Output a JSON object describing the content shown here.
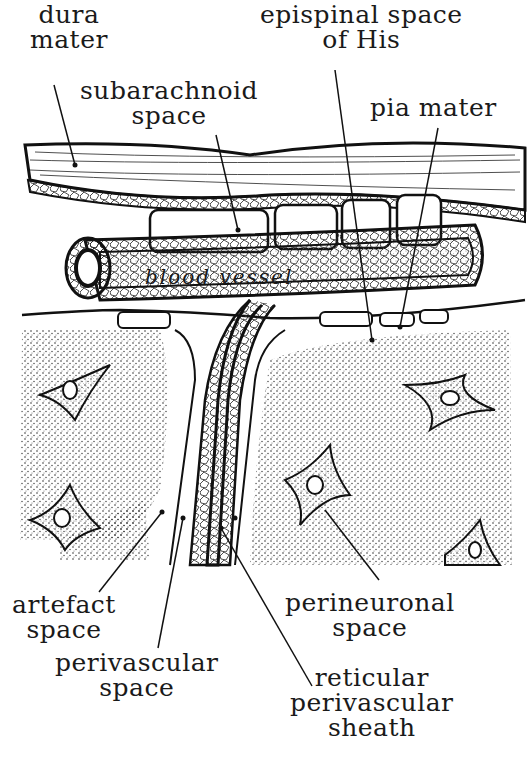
{
  "diagram": {
    "labels": {
      "dura_mater": [
        "dura",
        "mater"
      ],
      "epispinal_space": [
        "epispinal space",
        "of His"
      ],
      "subarachnoid_space": [
        "subarachnoid",
        "space"
      ],
      "pia_mater": [
        "pia mater"
      ],
      "blood_vessel": "blood vessel",
      "artefact_space": [
        "artefact",
        "space"
      ],
      "perivascular_space": [
        "perivascular",
        "space"
      ],
      "perineuronal_space": [
        "perineuronal",
        "space"
      ],
      "reticular_sheath": [
        "reticular",
        "perivascular",
        "sheath"
      ]
    },
    "colors": {
      "ink": "#111111",
      "paper": "#ffffff",
      "stipple": "#555555"
    }
  }
}
